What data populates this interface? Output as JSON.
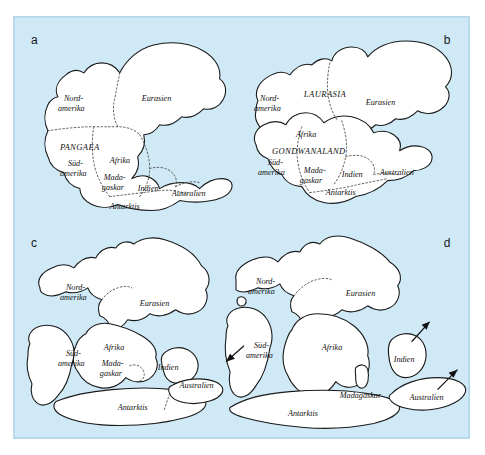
{
  "figure": {
    "background_color": "#cfe9f7",
    "border_color": "#b6d8ea",
    "land_fill": "#ffffff",
    "outline_color": "#1a1a1a",
    "suture_color": "#4a4a4a"
  },
  "panels": [
    {
      "id": "a",
      "label": "a",
      "supercontinents": [
        "PANGAEA"
      ],
      "labels": [
        "Nord-",
        "amerika",
        "Eurasien",
        "PANGAEA",
        "Süd-",
        "amerika",
        "Afrika",
        "Mada-",
        "gaskar",
        "Indien",
        "Australien",
        "Antarktis"
      ]
    },
    {
      "id": "b",
      "label": "b",
      "supercontinents": [
        "LAURASIA",
        "GONDWANALAND"
      ],
      "labels": [
        "Nord-",
        "amerika",
        "LAURASIA",
        "Eurasien",
        "Afrika",
        "GONDWANALAND",
        "Süd-",
        "amerika",
        "Mada-",
        "gaskar",
        "Indien",
        "Australien",
        "Antarktis"
      ]
    },
    {
      "id": "c",
      "label": "c",
      "supercontinents": [],
      "labels": [
        "Nord-",
        "amerika",
        "Eurasien",
        "Afrika",
        "Süd-",
        "amerika",
        "Mada-",
        "gaskar",
        "Indien",
        "Australien",
        "Antarktis"
      ]
    },
    {
      "id": "d",
      "label": "d",
      "supercontinents": [],
      "arrows": 4,
      "labels": [
        "Nord-",
        "amerika",
        "Eurasien",
        "Afrika",
        "Süd-",
        "amerika",
        "Madagaskar",
        "Indien",
        "Australien",
        "Antarktis"
      ]
    }
  ],
  "text": {
    "nordamerika_line1": "Nord-",
    "nordamerika_line2": "amerika",
    "eurasien": "Eurasien",
    "pangaea": "PANGAEA",
    "laurasia": "LAURASIA",
    "gondwanaland": "GONDWANALAND",
    "suedamerika_line1": "Süd-",
    "suedamerika_line2": "amerika",
    "afrika": "Afrika",
    "madagaskar_line1": "Mada-",
    "madagaskar_line2": "gaskar",
    "madagaskar_full": "Madagaskar",
    "indien": "Indien",
    "australien": "Australien",
    "antarktis": "Antarktis"
  }
}
